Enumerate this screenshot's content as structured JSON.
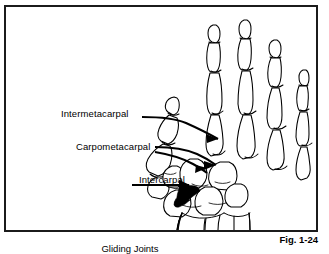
{
  "figure": {
    "number": "Fig. 1-24",
    "caption": "Gliding Joints",
    "border_color": "#1b1b1b",
    "line_color": "#000000",
    "background_color": "#ffffff"
  },
  "labels": {
    "intermetacarpal": "Intermetacarpal",
    "carpometacarpal": "Carpometacarpal",
    "intercarpal": "Intercarpal"
  },
  "leaders": {
    "intermetacarpal_count": 1,
    "carpometacarpal_count": 2,
    "intercarpal_count": 1
  },
  "illustration": {
    "name": "hand-skeleton-drawing",
    "digits": 5,
    "bone_groups": [
      "distal-phalanges",
      "middle-phalanges",
      "proximal-phalanges",
      "metacarpals",
      "carpals",
      "radius",
      "ulna"
    ]
  }
}
